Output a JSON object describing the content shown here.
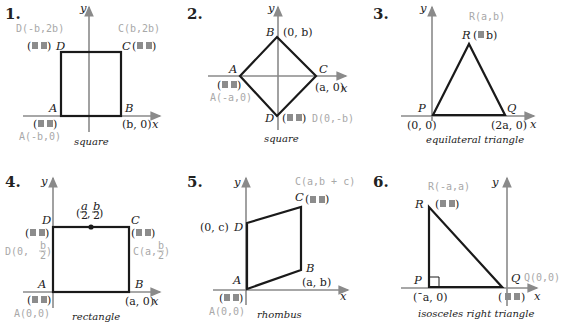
{
  "figures": [
    {
      "number": "1.",
      "caption": "square",
      "axes": {
        "x": "x",
        "y": "y"
      },
      "vertices": {
        "A": "A",
        "B": "B",
        "C": "C",
        "D": "D"
      },
      "given": {
        "B": "(b, 0)"
      },
      "answers": {
        "D": "D(-b,2b)",
        "C": "C(b,2b)",
        "A": "A(-b,0)"
      }
    },
    {
      "number": "2.",
      "caption": "square",
      "axes": {
        "x": "x",
        "y": "y"
      },
      "vertices": {
        "A": "A",
        "B": "B",
        "C": "C",
        "D": "D"
      },
      "given": {
        "B": "(0, b)",
        "C": "(a, 0)"
      },
      "answers": {
        "A": "A(-a,0)",
        "D": "D(0,-b)"
      }
    },
    {
      "number": "3.",
      "caption": "equilateral triangle",
      "axes": {
        "x": "x",
        "y": "y"
      },
      "vertices": {
        "P": "P",
        "Q": "Q",
        "R": "R"
      },
      "given": {
        "P": "(0, 0)",
        "Q": "(2a, 0)",
        "R_y": "b)",
        "R_open": "("
      },
      "answers": {
        "R": "R(a,b)"
      }
    },
    {
      "number": "4.",
      "caption": "rectangle",
      "axes": {
        "x": "x",
        "y": "y"
      },
      "vertices": {
        "A": "A",
        "B": "B",
        "C": "C",
        "D": "D"
      },
      "given": {
        "B": "(a, 0)",
        "mid_num_x": "a",
        "mid_num_y": "b",
        "mid_den": "2"
      },
      "answers": {
        "D_prefix": "D(0,",
        "D_num": "b",
        "D_den": "2",
        "C_prefix": "C(a,",
        "C_num": "b",
        "C_den": "2",
        "A": "A(0,0)"
      }
    },
    {
      "number": "5.",
      "caption": "rhombus",
      "axes": {
        "x": "x",
        "y": "y"
      },
      "vertices": {
        "A": "A",
        "B": "B",
        "C": "C",
        "D": "D"
      },
      "given": {
        "D": "(0, c)",
        "B": "(a, b)"
      },
      "answers": {
        "C": "C(a,b + c)",
        "A": "A(0,0)"
      }
    },
    {
      "number": "6.",
      "caption": "isosceles right triangle",
      "axes": {
        "x": "x",
        "y": "y"
      },
      "vertices": {
        "P": "P",
        "Q": "Q",
        "R": "R"
      },
      "given": {
        "P": "(ˉa, 0)",
        "Q_open": "(",
        "Q_close": ")"
      },
      "answers": {
        "R": "R(-a,a)",
        "Q": "Q(0,0)"
      }
    }
  ],
  "colors": {
    "shape": "#1a1a1a",
    "axis": "#8a8a8a",
    "answer": "#a8a8a8",
    "blank": "#8c8c8c"
  }
}
